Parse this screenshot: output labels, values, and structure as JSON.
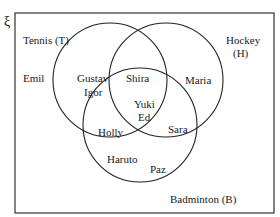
{
  "universal_symbol": "ξ",
  "sets": {
    "tennis": {
      "label": "Tennis (T)"
    },
    "hockey": {
      "label_line1": "Hockey",
      "label_line2": "(H)"
    },
    "badminton": {
      "label": "Badminton (B)"
    }
  },
  "regions": {
    "outside": [
      "Emil"
    ],
    "tennis_only": [
      "Gustav",
      "Igor"
    ],
    "hockey_only": [
      "Maria"
    ],
    "badminton_only": [
      "Haruto",
      "Paz"
    ],
    "tennis_hockey_only": [
      "Shira"
    ],
    "tennis_badminton_only": [
      "Holly"
    ],
    "hockey_badminton_only": [
      "Sara"
    ],
    "all_three": [
      "Yuki",
      "Ed"
    ]
  }
}
